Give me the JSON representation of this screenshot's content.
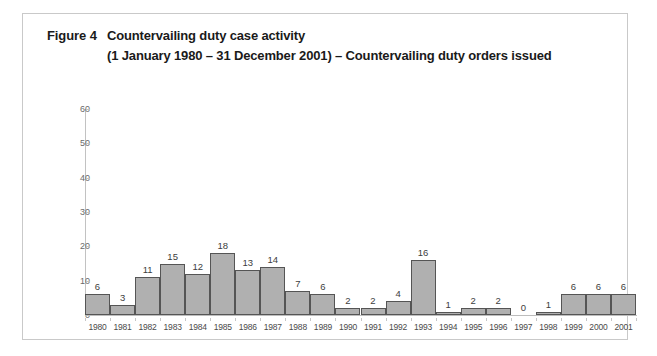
{
  "figure": {
    "label": "Figure 4",
    "title_line1": "Countervailing duty case activity",
    "title_line2": "(1 January 1980 – 31 December 2001) – Countervailing duty orders issued"
  },
  "colors": {
    "bar_fill": "#b0b0b0",
    "bar_border": "#555555",
    "axis": "#c2c2c2",
    "frame": "#c9c9c9",
    "text": "#1a1a1a"
  },
  "chart_data": {
    "type": "bar",
    "title": "Figure 4  Countervailing duty case activity (1 January 1980 – 31 December 2001) – Countervailing duty orders issued",
    "xlabel": "",
    "ylabel": "",
    "ylim": [
      0,
      60
    ],
    "yticks": [
      0,
      10,
      20,
      30,
      40,
      50,
      60
    ],
    "grid": false,
    "legend": null,
    "categories": [
      "1980",
      "1981",
      "1982",
      "1983",
      "1984",
      "1985",
      "1986",
      "1987",
      "1988",
      "1989",
      "1990",
      "1991",
      "1992",
      "1993",
      "1994",
      "1995",
      "1996",
      "1997",
      "1998",
      "1999",
      "2000",
      "2001"
    ],
    "values": [
      6,
      3,
      11,
      15,
      12,
      18,
      13,
      14,
      7,
      6,
      2,
      2,
      4,
      16,
      1,
      2,
      2,
      0,
      1,
      6,
      6,
      6
    ],
    "data_labels": [
      "6",
      "3",
      "11",
      "15",
      "12",
      "18",
      "13",
      "14",
      "7",
      "6",
      "2",
      "2",
      "4",
      "16",
      "1",
      "2",
      "2",
      "0",
      "1",
      "6",
      "6",
      "6"
    ]
  }
}
